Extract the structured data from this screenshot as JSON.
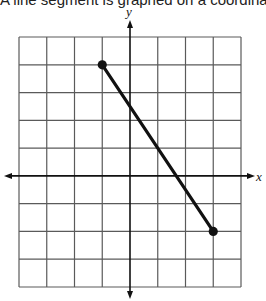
{
  "header": {
    "cut_text": "A line segment is graphed on a coordinate grid"
  },
  "axes": {
    "x_label": "x",
    "y_label": "y"
  },
  "colors": {
    "grid": "#5a5a5a",
    "axis": "#111111",
    "segment": "#111111",
    "background": "#ffffff"
  },
  "chart_data": {
    "type": "line",
    "title": "",
    "xlabel": "x",
    "ylabel": "y",
    "xlim": [
      -4,
      4
    ],
    "ylim": [
      -4,
      5
    ],
    "grid": true,
    "tick_labels": false,
    "series": [
      {
        "name": "segment",
        "points": [
          {
            "x": -1,
            "y": 4
          },
          {
            "x": 3,
            "y": -2
          }
        ],
        "endpoints_marked": true
      }
    ]
  }
}
